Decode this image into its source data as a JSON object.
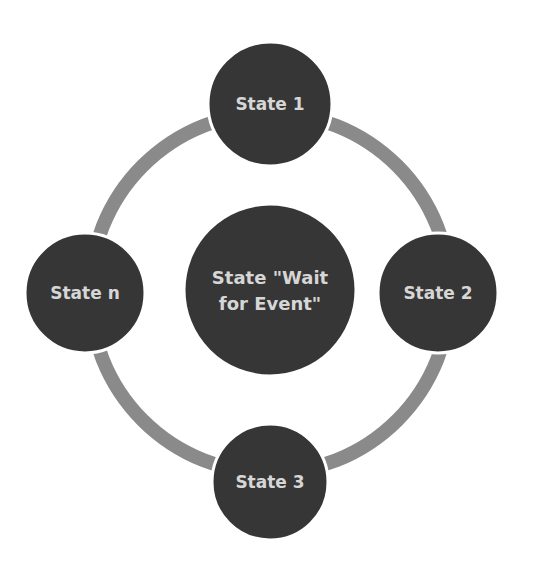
{
  "diagram": {
    "type": "cycle",
    "ring": {
      "cx": 270,
      "cy": 293,
      "r": 180,
      "stroke": "#8a8a8a",
      "stroke_width": 14
    },
    "center_node": {
      "id": "wait",
      "lines": [
        "State \"Wait",
        "for Event\""
      ],
      "cx": 270,
      "cy": 290,
      "r": 86
    },
    "nodes": [
      {
        "id": "state1",
        "label": "State 1",
        "cx": 270,
        "cy": 104,
        "r": 62
      },
      {
        "id": "state2",
        "label": "State 2",
        "cx": 438,
        "cy": 293,
        "r": 60
      },
      {
        "id": "state3",
        "label": "State 3",
        "cx": 270,
        "cy": 482,
        "r": 58
      },
      {
        "id": "staten",
        "label": "State n",
        "cx": 85,
        "cy": 293,
        "r": 60
      }
    ],
    "colors": {
      "node_fill": "#363636",
      "node_border": "#ffffff",
      "text": "#d6d6d6",
      "ring": "#8a8a8a",
      "background": "#ffffff"
    }
  }
}
